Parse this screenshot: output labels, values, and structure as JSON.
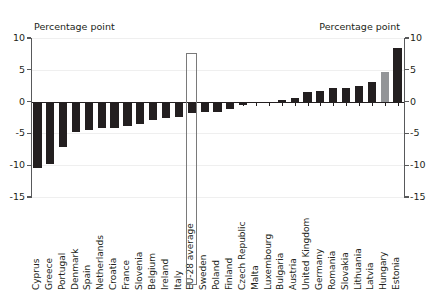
{
  "header": {
    "left_label": "Percentage point",
    "right_label": "Percentage point"
  },
  "axis": {
    "ticks": [
      "10",
      "5",
      "0",
      "-5",
      "-10",
      "-15"
    ]
  },
  "colors": {
    "bar": "#231f20",
    "bar_highlight": "#939598",
    "axis": "#58595b",
    "grid": "#efefef",
    "box": "#7a7a7a"
  },
  "highlight": {
    "category": "EU-28 average"
  },
  "chart_data": {
    "type": "bar",
    "title": "",
    "subtitle": "",
    "xlabel": "",
    "ylabel": "Percentage point",
    "ylim": [
      -15,
      10
    ],
    "yticks": [
      10,
      5,
      0,
      -5,
      -10,
      -15
    ],
    "grid": true,
    "legend": "none",
    "categories": [
      "Cyprus",
      "Greece",
      "Portugal",
      "Denmark",
      "Spain",
      "Netherlands",
      "Croatia",
      "France",
      "Slovenia",
      "Belgium",
      "Ireland",
      "Italy",
      "EU-28 average",
      "Sweden",
      "Poland",
      "Finland",
      "Czech Republic",
      "Malta",
      "Luxembourg",
      "Bulgaria",
      "Austria",
      "United Kingdom",
      "Germany",
      "Romania",
      "Slovakia",
      "Lithuania",
      "Latvia",
      "Hungary",
      "Estonia"
    ],
    "values": [
      -10.5,
      -9.8,
      -7.1,
      -4.8,
      -4.5,
      -4.2,
      -4.1,
      -3.9,
      -3.5,
      -2.9,
      -2.6,
      -2.4,
      -1.8,
      -1.7,
      -1.6,
      -1.1,
      -0.6,
      -0.2,
      -0.1,
      0.2,
      0.5,
      1.5,
      1.6,
      2.1,
      2.1,
      2.5,
      3.1,
      4.7,
      8.4
    ],
    "highlight_index": 12,
    "highlight_color_index": 27
  }
}
